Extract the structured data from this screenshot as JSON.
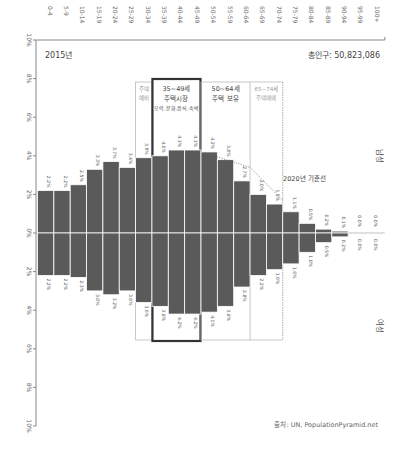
{
  "chart_data": {
    "type": "bar",
    "subtype": "population-pyramid",
    "title": "2015년",
    "subtitle": "총인구: 50,823,086",
    "source": "출처: UN, PopulationPyramid.net",
    "orientation": "vertical",
    "categories": [
      "0-4",
      "5-9",
      "10-14",
      "15-19",
      "20-24",
      "25-29",
      "30-34",
      "35-39",
      "40-44",
      "45-49",
      "50-54",
      "55-59",
      "60-64",
      "65-69",
      "70-74",
      "75-79",
      "80-84",
      "85-89",
      "90-94",
      "95-99",
      "100+"
    ],
    "series": [
      {
        "name": "남성",
        "direction": "up",
        "values": [
          2.2,
          2.2,
          2.5,
          3.3,
          3.7,
          3.4,
          3.9,
          4.0,
          4.3,
          4.3,
          4.2,
          3.8,
          2.7,
          2.0,
          1.5,
          1.1,
          0.5,
          0.2,
          0.1,
          0.0,
          0.0
        ],
        "labels": [
          "2.2%",
          "2.2%",
          "2.5%",
          "3.3%",
          "3.7%",
          "3.4%",
          "3.9%",
          "4.0%",
          "4.3%",
          "4.3%",
          "4.2%",
          "3.8%",
          "2.7%",
          "2.0%",
          "1.5%",
          "1.1%",
          "0.5%",
          "0.2%",
          "0.1%",
          "0.0%",
          "0.0%"
        ]
      },
      {
        "name": "여성",
        "direction": "down",
        "values": [
          2.2,
          2.2,
          2.3,
          3.0,
          3.2,
          3.0,
          3.6,
          3.8,
          4.2,
          4.2,
          4.1,
          3.8,
          2.8,
          2.2,
          1.9,
          1.6,
          1.0,
          0.5,
          0.2,
          0.0,
          0.0
        ],
        "labels": [
          "2.2%",
          "2.2%",
          "2.3%",
          "3.0%",
          "3.2%",
          "3.0%",
          "3.6%",
          "3.8%",
          "4.2%",
          "4.2%",
          "4.1%",
          "3.8%",
          "2.8%",
          "2.2%",
          "1.9%",
          "1.6%",
          "1.0%",
          "0.5%",
          "0.2%",
          "0.0%",
          "0.0%"
        ]
      }
    ],
    "yaxis": {
      "ticks": [
        "10%",
        "8%",
        "6%",
        "4%",
        "2%",
        "0%",
        "2%",
        "4%",
        "6%",
        "8%",
        "10%"
      ],
      "range": [
        -10,
        10
      ]
    },
    "grid": false,
    "annotations": [
      {
        "type": "box",
        "from": "30-34",
        "to": "30-34",
        "lines": [
          "주택",
          "예비"
        ],
        "style": "thin-muted"
      },
      {
        "type": "box",
        "from": "35-39",
        "to": "45-49",
        "lines": [
          "35~49세",
          "주택시장",
          "오락,문화,음식,숙박"
        ],
        "style": "thick"
      },
      {
        "type": "box",
        "from": "50-54",
        "to": "60-64",
        "lines": [
          "50~64세",
          "주택 보유"
        ],
        "style": "thin"
      },
      {
        "type": "box",
        "from": "65-69",
        "to": "70-74",
        "lines": [
          "65~74세",
          "주택매매"
        ],
        "style": "thin-dashed-right"
      },
      {
        "type": "dotted-line",
        "label": "2020년 기준선"
      }
    ],
    "gender_labels": {
      "top": "남성",
      "bottom": "여성"
    }
  }
}
